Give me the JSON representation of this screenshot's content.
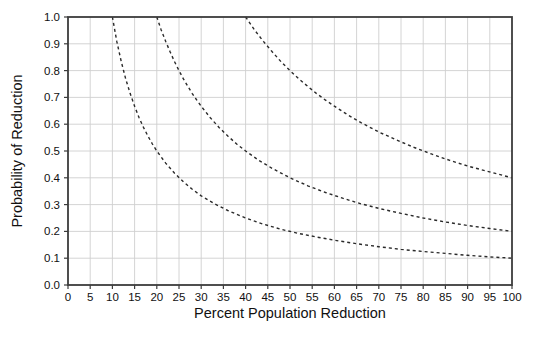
{
  "figure": {
    "background": "#ffffff"
  },
  "chart_data": {
    "type": "line",
    "title": "",
    "xlabel": "Percent Population Reduction",
    "ylabel": "Probability of Reduction",
    "xlim": [
      0,
      100
    ],
    "ylim": [
      0.0,
      1.0
    ],
    "x_ticks": [
      0,
      5,
      10,
      15,
      20,
      25,
      30,
      35,
      40,
      45,
      50,
      55,
      60,
      65,
      70,
      75,
      80,
      85,
      90,
      95,
      100
    ],
    "y_ticks": [
      "0.0",
      "0.1",
      "0.2",
      "0.3",
      "0.4",
      "0.5",
      "0.6",
      "0.7",
      "0.8",
      "0.9",
      "1.0"
    ],
    "grid": true,
    "grid_x_step": 5,
    "grid_y_step": 0.1,
    "legend_position": "none",
    "line_style": "dashed",
    "colors": {
      "curve": "#2a2a2a",
      "grid": "#cfcfcf",
      "axis": "#3c3c3c",
      "text": "#111111",
      "background": "#ffffff"
    },
    "series": [
      {
        "name": "curve-xy-10",
        "points": [
          [
            10,
            1.0
          ],
          [
            11,
            0.909
          ],
          [
            12,
            0.833
          ],
          [
            13,
            0.769
          ],
          [
            14,
            0.714
          ],
          [
            15,
            0.667
          ],
          [
            16,
            0.625
          ],
          [
            17,
            0.588
          ],
          [
            18,
            0.556
          ],
          [
            19,
            0.526
          ],
          [
            20,
            0.5
          ],
          [
            22,
            0.455
          ],
          [
            24,
            0.417
          ],
          [
            26,
            0.385
          ],
          [
            28,
            0.357
          ],
          [
            30,
            0.333
          ],
          [
            33,
            0.303
          ],
          [
            36,
            0.278
          ],
          [
            40,
            0.25
          ],
          [
            44,
            0.227
          ],
          [
            48,
            0.208
          ],
          [
            52,
            0.192
          ],
          [
            56,
            0.179
          ],
          [
            60,
            0.167
          ],
          [
            65,
            0.154
          ],
          [
            70,
            0.143
          ],
          [
            75,
            0.133
          ],
          [
            80,
            0.125
          ],
          [
            85,
            0.118
          ],
          [
            90,
            0.111
          ],
          [
            95,
            0.105
          ],
          [
            100,
            0.1
          ]
        ]
      },
      {
        "name": "curve-xy-20",
        "points": [
          [
            20,
            1.0
          ],
          [
            21,
            0.952
          ],
          [
            22,
            0.909
          ],
          [
            23,
            0.87
          ],
          [
            24,
            0.833
          ],
          [
            25,
            0.8
          ],
          [
            26,
            0.769
          ],
          [
            27,
            0.741
          ],
          [
            28,
            0.714
          ],
          [
            29,
            0.69
          ],
          [
            30,
            0.667
          ],
          [
            32,
            0.625
          ],
          [
            34,
            0.588
          ],
          [
            36,
            0.556
          ],
          [
            38,
            0.526
          ],
          [
            40,
            0.5
          ],
          [
            43,
            0.465
          ],
          [
            46,
            0.435
          ],
          [
            50,
            0.4
          ],
          [
            54,
            0.37
          ],
          [
            58,
            0.345
          ],
          [
            62,
            0.323
          ],
          [
            66,
            0.303
          ],
          [
            70,
            0.286
          ],
          [
            75,
            0.267
          ],
          [
            80,
            0.25
          ],
          [
            85,
            0.235
          ],
          [
            90,
            0.222
          ],
          [
            95,
            0.211
          ],
          [
            100,
            0.2
          ]
        ]
      },
      {
        "name": "curve-xy-40",
        "points": [
          [
            40,
            1.0
          ],
          [
            42,
            0.952
          ],
          [
            44,
            0.909
          ],
          [
            46,
            0.87
          ],
          [
            48,
            0.833
          ],
          [
            50,
            0.8
          ],
          [
            52,
            0.769
          ],
          [
            54,
            0.741
          ],
          [
            56,
            0.714
          ],
          [
            58,
            0.69
          ],
          [
            60,
            0.667
          ],
          [
            63,
            0.635
          ],
          [
            66,
            0.606
          ],
          [
            70,
            0.571
          ],
          [
            74,
            0.541
          ],
          [
            78,
            0.513
          ],
          [
            82,
            0.488
          ],
          [
            86,
            0.465
          ],
          [
            90,
            0.444
          ],
          [
            94,
            0.426
          ],
          [
            100,
            0.4
          ]
        ]
      }
    ]
  }
}
